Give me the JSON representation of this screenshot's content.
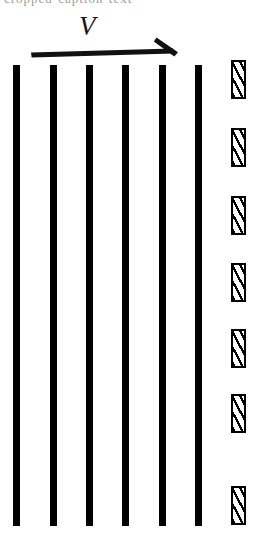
{
  "figure": {
    "title_sliver": "cropped-caption-text",
    "background_color": "#ffffff",
    "ink_color": "#000000",
    "width": 262,
    "height": 552,
    "velocity_label": "V",
    "arrow": {
      "name": "velocity-arrow",
      "direction": "right",
      "shaft_x_start": 32,
      "shaft_x_end": 168,
      "shaft_y": 51,
      "shaft_thickness": 5,
      "head_tip_x": 178,
      "head_tip_y": 53
    },
    "bars": {
      "name": "vertical-bar",
      "count": 6,
      "color": "#000000",
      "width": 7,
      "top": 65,
      "bottom": 526,
      "x_positions": [
        13,
        50,
        86,
        122,
        159,
        195
      ]
    },
    "hatched_blocks": {
      "name": "hatched-block",
      "count": 7,
      "fill": "diagonal-hatch",
      "border_color": "#000000",
      "border_width": 2,
      "x": 231,
      "width": 15,
      "height": 39,
      "y_positions": [
        60,
        128,
        196,
        263,
        329,
        394,
        486
      ]
    }
  }
}
